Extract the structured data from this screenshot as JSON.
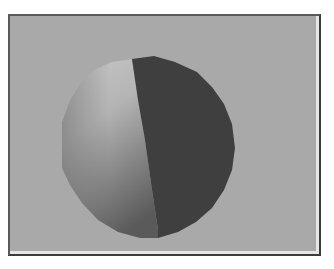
{
  "viewport": {
    "background_color": "#a9a9a9",
    "object": {
      "type": "sphere",
      "shading": "flat-polygon gradient",
      "lit_color_top": "#c4c4c4",
      "lit_color_bottom": "#5e5e5e",
      "shadow_color": "#3f3f3f"
    }
  },
  "colors": {
    "frame_dark": "#3c3c3c",
    "frame_highlight": "#e6e6e6",
    "page_background": "#ffffff"
  }
}
